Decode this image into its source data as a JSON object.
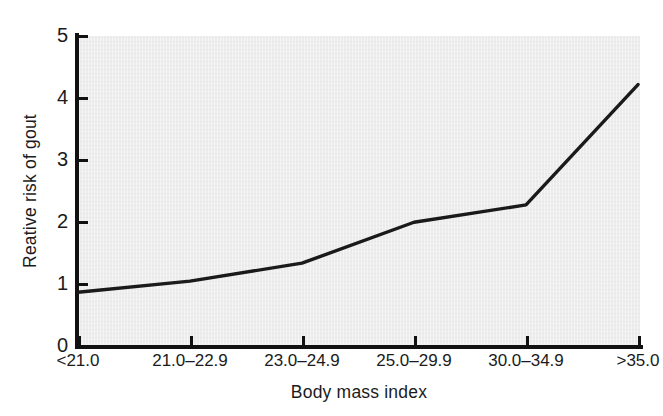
{
  "chart_data": {
    "type": "line",
    "title": "",
    "xlabel": "Body mass index",
    "ylabel": "Reative risk of gout",
    "categories": [
      "<21.0",
      "21.0–22.9",
      "23.0–24.9",
      "25.0–29.9",
      "30.0–34.9",
      ">35.0"
    ],
    "values": [
      0.85,
      1.03,
      1.32,
      1.98,
      2.26,
      4.2
    ],
    "series": [
      {
        "name": "Relative risk of gout",
        "values": [
          0.85,
          1.03,
          1.32,
          1.98,
          2.26,
          4.2
        ]
      }
    ],
    "ylim": [
      0,
      5
    ],
    "yticks": [
      0,
      1,
      2,
      3,
      4,
      5
    ],
    "ytick_labels": [
      "0",
      "1",
      "2",
      "3",
      "4",
      "5"
    ],
    "grid": false,
    "legend": "none",
    "line_color": "#1a1a1a",
    "panel_color": "#ededed",
    "axis_color": "#111111",
    "marker": "none"
  },
  "axes": {
    "y_title": "Reative risk of gout",
    "x_title": "Body mass index",
    "y_labels": [
      "5",
      "4",
      "3",
      "2",
      "1",
      "0"
    ],
    "x_labels": [
      "<21.0",
      "21.0–22.9",
      "23.0–24.9",
      "25.0–29.9",
      "30.0–34.9",
      ">35.0"
    ]
  }
}
